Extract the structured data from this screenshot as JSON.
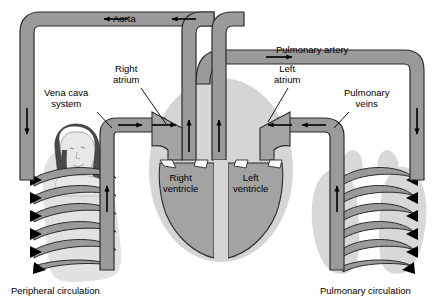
{
  "diagram": {
    "colors": {
      "vessel_fill": "#9a9a9a",
      "vessel_stroke": "#2b2b2b",
      "heart_silhouette": "#d5d5d5",
      "ventricle_fill": "#a3a3a3",
      "lung_fill": "#d8d8d8",
      "body_fill": "#e2e2e2",
      "background": "#ffffff",
      "text": "#000000",
      "arrow": "#000000"
    },
    "labels": {
      "aorta": "Aorta",
      "pulmonary_artery": "Pulmonary artery",
      "right_atrium": "Right\natrium",
      "left_atrium": "Left\natrium",
      "vena_cava": "Vena cava\nsystem",
      "pulmonary_veins": "Pulmonary\nveins",
      "right_ventricle": "Right\nventricle",
      "left_ventricle": "Left\nventricle",
      "peripheral_circulation": "Peripheral circulation",
      "pulmonary_circulation": "Pulmonary circulation"
    },
    "flow_arrows": [
      {
        "name": "aorta-arrow-left",
        "direction": "left"
      },
      {
        "name": "aorta-arrow-right",
        "direction": "left"
      },
      {
        "name": "aorta-descending-arrow",
        "direction": "down"
      },
      {
        "name": "vena-cava-arrow-1",
        "direction": "right"
      },
      {
        "name": "vena-cava-arrow-2",
        "direction": "right"
      },
      {
        "name": "vena-cava-ascending-arrow",
        "direction": "up"
      },
      {
        "name": "right-ventricle-outflow-arrow",
        "direction": "up"
      },
      {
        "name": "pulmonary-artery-arrow",
        "direction": "right"
      },
      {
        "name": "pulmonary-artery-descending-arrow",
        "direction": "down"
      },
      {
        "name": "pulmonary-vein-arrow-1",
        "direction": "left"
      },
      {
        "name": "pulmonary-vein-arrow-2",
        "direction": "left"
      },
      {
        "name": "pulmonary-vein-ascending-arrow",
        "direction": "up"
      },
      {
        "name": "left-ventricle-outflow-arrow",
        "direction": "up"
      }
    ]
  }
}
